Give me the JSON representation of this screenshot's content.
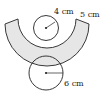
{
  "diagram": {
    "top_circle": {
      "radius_label": "4 cm"
    },
    "arc_band": {
      "width_label": "5 cm",
      "fill": "#e6e6e6"
    },
    "bottom_circle": {
      "radius_label": "6 cm"
    },
    "stroke_color": "#222222"
  }
}
